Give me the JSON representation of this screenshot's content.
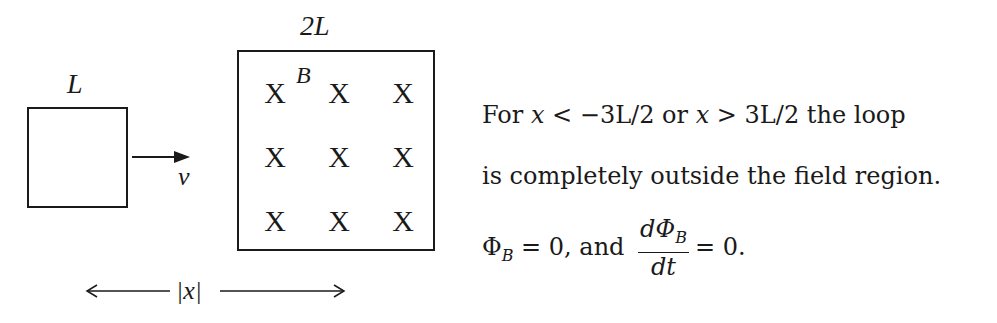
{
  "diagram": {
    "loop": {
      "side_label": "L",
      "velocity_label": "v"
    },
    "field_region": {
      "side_label": "2L",
      "field_label": "B",
      "field_symbol": "X",
      "grid": [
        [
          "X",
          "X",
          "X"
        ],
        [
          "X",
          "X",
          "X"
        ],
        [
          "X",
          "X",
          "X"
        ]
      ]
    },
    "distance": {
      "label": "|x|"
    }
  },
  "explanation": {
    "line1": {
      "prefix": "For ",
      "var1": "x",
      "cond1": " < −3L/2 ",
      "or": "or ",
      "var2": "x",
      "cond2": " > 3L/2 ",
      "suffix": "the loop"
    },
    "line2": "is completely outside the field region.",
    "line3": {
      "phi": "Φ",
      "phi_sub": "B",
      "eq1": " = 0, and ",
      "frac_num": "dΦ",
      "frac_num_sub": "B",
      "frac_den": "dt",
      "eq2": "= 0."
    }
  }
}
